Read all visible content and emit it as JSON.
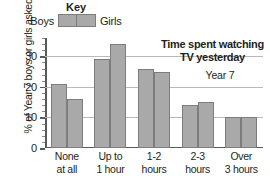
{
  "key": {
    "title": "Key",
    "boys_label": "Boys",
    "girls_label": "Girls"
  },
  "annotations": {
    "title_line1": "Time spent watching",
    "title_line2": "TV yesterday",
    "year_note": "Year 7"
  },
  "axis": {
    "y_title": "% of Year 7 boys or girls asked",
    "y_ticks": [
      "0",
      "10",
      "20",
      "30"
    ]
  },
  "colors": {
    "bar_fill": "#a9a9a9",
    "bar_border": "#7d7d7d",
    "gridline": "#b9b9b9",
    "axis": "#58595b",
    "text": "#231f20"
  },
  "chart_data": {
    "type": "bar",
    "title": "Time spent watching TV yesterday",
    "subtitle": "Year 7",
    "xlabel": "",
    "ylabel": "% of Year 7 boys or girls asked",
    "ylim": [
      0,
      36
    ],
    "yticks": [
      0,
      10,
      20,
      30
    ],
    "minor_tick_step": 2,
    "grid": true,
    "legend": "Key",
    "legend_position": "top",
    "categories": [
      "None at all",
      "Up to 1 hour",
      "1-2 hours",
      "2-3 hours",
      "Over 3 hours"
    ],
    "category_lines": [
      [
        "None",
        "at all"
      ],
      [
        "Up to",
        "1 hour"
      ],
      [
        "1-2",
        "hours"
      ],
      [
        "2-3",
        "hours"
      ],
      [
        "Over",
        "3 hours"
      ]
    ],
    "series": [
      {
        "name": "Boys",
        "values": [
          21,
          29,
          26,
          14,
          10
        ]
      },
      {
        "name": "Girls",
        "values": [
          16,
          34,
          25,
          15,
          10
        ]
      }
    ]
  }
}
